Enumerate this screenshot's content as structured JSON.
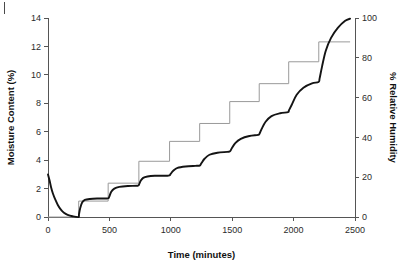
{
  "figure": {
    "background": "#ffffff",
    "corner_mark": "|"
  },
  "chart_data": {
    "type": "line",
    "title": "",
    "xlabel": "Time (minutes)",
    "ylabel": "Moisture Content (%)",
    "y2label": "% Relative Humidity",
    "xlim": [
      0,
      2500
    ],
    "ylim": [
      0,
      14
    ],
    "y2lim": [
      0,
      100
    ],
    "grid": false,
    "legend": "none",
    "xticks": [
      0,
      500,
      1000,
      1500,
      2000,
      2500
    ],
    "xtick_labels": [
      "0",
      "500",
      "1000",
      "1500",
      "2000",
      "2500"
    ],
    "yticks": [
      0,
      2,
      4,
      6,
      8,
      10,
      12,
      14
    ],
    "ytick_labels": [
      "0",
      "2",
      "4",
      "6",
      "8",
      "10",
      "12",
      "14"
    ],
    "y2ticks": [
      0,
      20,
      40,
      60,
      80,
      100
    ],
    "y2tick_labels": [
      "0",
      "20",
      "40",
      "60",
      "80",
      "100"
    ],
    "series": [
      {
        "name": "% Relative Humidity",
        "axis": "right",
        "style": "step",
        "color": "#9a9a9a",
        "x": [
          0,
          250,
          250,
          490,
          490,
          740,
          740,
          990,
          990,
          1235,
          1235,
          1480,
          1480,
          1720,
          1720,
          1960,
          1960,
          2205,
          2205,
          2460
        ],
        "values": [
          0,
          0,
          8,
          8,
          17,
          17,
          28,
          28,
          38,
          38,
          47,
          47,
          58,
          58,
          67,
          67,
          78,
          78,
          88,
          88
        ]
      },
      {
        "name": "Moisture Content (%)",
        "axis": "left",
        "style": "curve",
        "color": "#141414",
        "x": [
          0,
          12,
          25,
          40,
          58,
          80,
          105,
          130,
          160,
          200,
          248,
          252,
          262,
          278,
          300,
          340,
          400,
          470,
          492,
          500,
          515,
          540,
          580,
          650,
          730,
          742,
          755,
          775,
          810,
          870,
          960,
          988,
          1000,
          1020,
          1055,
          1120,
          1200,
          1236,
          1250,
          1275,
          1315,
          1380,
          1460,
          1482,
          1498,
          1525,
          1570,
          1640,
          1710,
          1722,
          1740,
          1772,
          1820,
          1890,
          1955,
          1962,
          1985,
          2025,
          2080,
          2150,
          2203,
          2212,
          2232,
          2262,
          2305,
          2360,
          2420,
          2460
        ],
        "values": [
          3.0,
          2.6,
          2.1,
          1.65,
          1.25,
          0.85,
          0.52,
          0.3,
          0.15,
          0.05,
          0.0,
          0.18,
          0.62,
          1.02,
          1.2,
          1.27,
          1.3,
          1.3,
          1.32,
          1.45,
          1.78,
          2.0,
          2.12,
          2.18,
          2.2,
          2.3,
          2.55,
          2.75,
          2.85,
          2.9,
          2.9,
          2.92,
          3.05,
          3.25,
          3.45,
          3.55,
          3.6,
          3.62,
          3.8,
          4.1,
          4.38,
          4.52,
          4.58,
          4.62,
          4.85,
          5.2,
          5.5,
          5.7,
          5.78,
          5.85,
          6.2,
          6.7,
          7.1,
          7.3,
          7.38,
          7.5,
          7.9,
          8.6,
          9.1,
          9.4,
          9.5,
          9.75,
          10.6,
          11.7,
          12.6,
          13.3,
          13.8,
          13.95
        ]
      }
    ]
  }
}
